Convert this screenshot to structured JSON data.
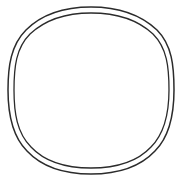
{
  "canvas": {
    "width": 183,
    "height": 186,
    "background_color": "#ffffff",
    "title": "double circle outline"
  },
  "figure": {
    "name": "double-circle",
    "style": "line-art",
    "stroke_color": "#2b2b2b",
    "fill_color": "none",
    "shape_count": 2,
    "interior_content": "empty"
  },
  "shapes": [
    {
      "name": "outer-ring",
      "type": "circle",
      "center_x": 91,
      "center_y": 90.5,
      "radius_x": 83,
      "radius_y": 83.5,
      "stroke_width": 1.5,
      "stroke_color": "#2b2b2b",
      "path": "M 91 7 C 118 7 141 15 157 30 C 172 45 174 66 174 90 C 174 114 170 136 155 151 C 140 167 117 174 91 174 C 65 174 42 167 27 151 C 12 136 8 114 8 90 C 8 66 11 45 26 30 C 41 15 64 7 91 7 Z"
    },
    {
      "name": "inner-ring",
      "type": "circle",
      "center_x": 91,
      "center_y": 90.5,
      "radius_x": 78,
      "radius_y": 78.5,
      "stroke_width": 1.3,
      "stroke_color": "#2b2b2b",
      "path": "M 91 13 C 116 13 138 20 153 34 C 167 48 169 67 169 90 C 169 113 165 133 151 147 C 137 162 115 168 91 168 C 67 168 45 162 31 147 C 17 133 14 113 14 90 C 14 67 16 48 30 34 C 45 20 66 13 91 13 Z"
    }
  ]
}
